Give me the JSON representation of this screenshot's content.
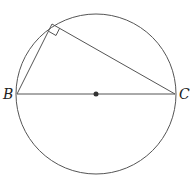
{
  "diagram": {
    "type": "geometry",
    "circle": {
      "cx": 96,
      "cy": 94,
      "r": 80,
      "stroke": "#555555"
    },
    "center_point": {
      "x": 96,
      "y": 94
    },
    "points": {
      "B": {
        "label": "B",
        "x": 17,
        "y": 94
      },
      "C": {
        "label": "C",
        "x": 175,
        "y": 94
      },
      "A": {
        "label": "",
        "x": 52,
        "y": 24
      }
    },
    "segments": [
      {
        "from": "B",
        "to": "C",
        "name": "diameter"
      },
      {
        "from": "B",
        "to": "A",
        "name": "side-ba"
      },
      {
        "from": "A",
        "to": "C",
        "name": "side-ac"
      }
    ],
    "right_angle_marker_at": "A",
    "labels": {
      "B": "B",
      "C": "C"
    },
    "line_color": "#555555"
  }
}
